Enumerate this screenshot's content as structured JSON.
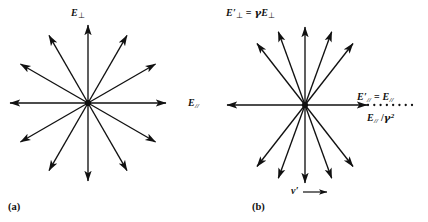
{
  "figure": {
    "background_color": "#ffffff",
    "ink_color": "#111111",
    "panels": [
      {
        "id": "a",
        "caption": "(a)",
        "center": {
          "x": 88,
          "y": 103
        },
        "description": "static-charge-radial-field",
        "vector_count": 12,
        "vector_angles_deg": [
          0,
          30,
          60,
          90,
          120,
          150,
          180,
          210,
          240,
          270,
          300,
          330
        ],
        "vector_radius": 78,
        "axis_labels": {
          "perpendicular": {
            "base": "E",
            "sub": "⊥",
            "text": "E⊥"
          },
          "parallel": {
            "base": "E",
            "sub": "//",
            "text": "E//"
          }
        }
      },
      {
        "id": "b",
        "caption": "(b)",
        "center": {
          "x": 305,
          "y": 105
        },
        "description": "moving-charge-compressed-radial-field",
        "vector_count": 12,
        "vector_angles_deg": [
          0,
          52,
          70,
          90,
          110,
          128,
          180,
          232,
          250,
          270,
          290,
          308
        ],
        "vector_radius": 78,
        "parallel_arrow_radius": 62,
        "dotted_extension": {
          "from_x": 368,
          "to_x": 412,
          "y": 105,
          "dot_count": 8
        },
        "axis_labels": {
          "perpendicular": {
            "text": "E'⊥ = γE⊥"
          },
          "parallel": {
            "text": "E'// = E//"
          },
          "parallel_reduced": {
            "text": "E// / γ²"
          },
          "velocity": {
            "text": "v'"
          }
        }
      }
    ]
  },
  "labels": {
    "e_perp_a": {
      "symbol": "E",
      "sub": "⊥"
    },
    "e_par_a": {
      "symbol": "E",
      "sub": "//"
    },
    "e_perp_b": {
      "prime_symbol": "E",
      "sub": "⊥",
      "equals": "=",
      "gamma": "γ",
      "rhs_symbol": "E",
      "rhs_sub": "⊥"
    },
    "e_par_b": {
      "prime_symbol": "E",
      "sub": "//",
      "equals": "=",
      "rhs_symbol": "E",
      "rhs_sub": "//"
    },
    "e_par_gamma2_b": {
      "symbol": "E",
      "sub": "//",
      "slash": "/",
      "gamma": "γ",
      "power": "2"
    },
    "v_prime_b": {
      "symbol": "v",
      "prime": "′",
      "arrow": "⟶"
    },
    "panel_a": "(a)",
    "panel_b": "(b)"
  }
}
